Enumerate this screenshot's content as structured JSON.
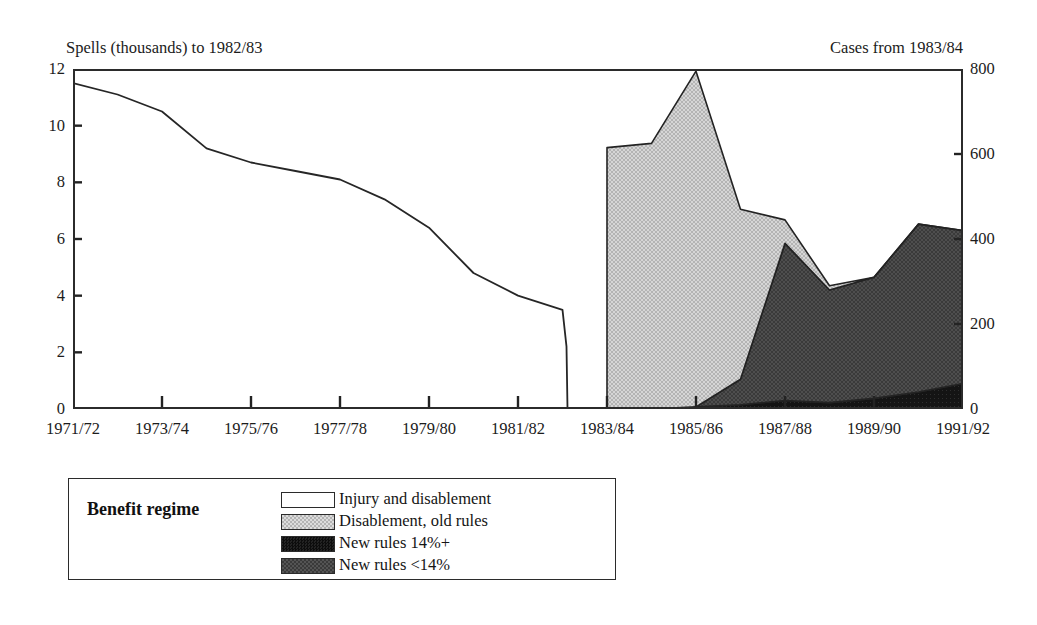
{
  "title_remnant": "",
  "axis_captions": {
    "left": "Spells (thousands) to 1982/83",
    "right": "Cases from 1983/84"
  },
  "legend": {
    "title": "Benefit regime",
    "items": [
      {
        "label": "Injury and disablement",
        "color": "#ffffff",
        "key": "injury_and_disablement"
      },
      {
        "label": "Disablement, old rules",
        "color": "#c9c9c9",
        "key": "disablement_old_rules"
      },
      {
        "label": "New rules 14%+",
        "color": "#121212",
        "key": "new_rules_14_plus"
      },
      {
        "label": "New rules <14%",
        "color": "#4a4a4a",
        "key": "new_rules_under_14"
      }
    ]
  },
  "chart_data": {
    "type": "area",
    "title": "",
    "xlabel": "",
    "grid": false,
    "legend_position": "bottom-left",
    "categories": [
      "1971/72",
      "1972/73",
      "1973/74",
      "1974/75",
      "1975/76",
      "1976/77",
      "1977/78",
      "1978/79",
      "1979/80",
      "1980/81",
      "1981/82",
      "1982/83",
      "1983/84",
      "1984/85",
      "1985/86",
      "1986/87",
      "1987/88",
      "1988/89",
      "1989/90",
      "1990/91",
      "1991/92"
    ],
    "x_tick_labels": [
      "1971/72",
      "1973/74",
      "1975/76",
      "1977/78",
      "1979/80",
      "1981/82",
      "1983/84",
      "1985/86",
      "1987/88",
      "1989/90",
      "1991/92"
    ],
    "left_axis": {
      "label": "Spells (thousands) to 1982/83",
      "ylim": [
        0,
        12
      ],
      "ticks": [
        0,
        2,
        4,
        6,
        8,
        10,
        12
      ],
      "tick_labels": [
        "0",
        "2",
        "4",
        "6",
        "8",
        "10",
        "12"
      ]
    },
    "right_axis": {
      "label": "Cases from 1983/84",
      "ylim": [
        0,
        800
      ],
      "ticks": [
        0,
        200,
        400,
        600,
        800
      ],
      "tick_labels": [
        "0",
        "200",
        "400",
        "600",
        "800"
      ]
    },
    "series": [
      {
        "name": "Injury and disablement",
        "axis": "left",
        "render": "line",
        "units": "spells (thousands)",
        "x": [
          "1971/72",
          "1972/73",
          "1973/74",
          "1974/75",
          "1975/76",
          "1976/77",
          "1977/78",
          "1978/79",
          "1979/80",
          "1980/81",
          "1981/82",
          "1982/83"
        ],
        "values": [
          11.5,
          11.1,
          10.5,
          9.2,
          8.7,
          8.4,
          8.1,
          7.4,
          6.4,
          4.8,
          4.0,
          3.5
        ],
        "end_drop_to_zero": true
      },
      {
        "name": "Disablement, old rules",
        "axis": "right",
        "render": "stacked-area",
        "units": "cases",
        "x": [
          "1983/84",
          "1984/85",
          "1985/86",
          "1986/87",
          "1987/88",
          "1988/89",
          "1989/90",
          "1990/91",
          "1991/92"
        ],
        "values": [
          615,
          625,
          790,
          400,
          55,
          10,
          0,
          0,
          0
        ]
      },
      {
        "name": "New rules <14%",
        "axis": "right",
        "render": "stacked-area",
        "units": "cases",
        "x": [
          "1983/84",
          "1984/85",
          "1985/86",
          "1986/87",
          "1987/88",
          "1988/89",
          "1989/90",
          "1990/91",
          "1991/92"
        ],
        "values": [
          0,
          0,
          0,
          60,
          370,
          265,
          285,
          395,
          360
        ]
      },
      {
        "name": "New rules 14%+",
        "axis": "right",
        "render": "stacked-area",
        "units": "cases",
        "x": [
          "1983/84",
          "1984/85",
          "1985/86",
          "1986/87",
          "1987/88",
          "1988/89",
          "1989/90",
          "1990/91",
          "1991/92"
        ],
        "values": [
          0,
          0,
          5,
          10,
          20,
          15,
          25,
          40,
          60
        ]
      }
    ]
  }
}
